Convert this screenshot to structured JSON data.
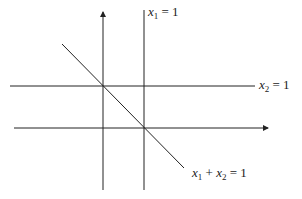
{
  "diagram": {
    "type": "linear-constraints",
    "axes": {
      "horizontal": "x1-axis",
      "vertical": "x2-axis"
    },
    "lines": [
      {
        "name": "x1 = 1",
        "var1": "x",
        "sub1": "1",
        "rhs": "= 1"
      },
      {
        "name": "x2 = 1",
        "var1": "x",
        "sub1": "2",
        "rhs": "= 1"
      },
      {
        "name": "x1 + x2 = 1",
        "var1": "x",
        "sub1": "1",
        "op": "+",
        "var2": "x",
        "sub2": "2",
        "rhs": "= 1"
      }
    ],
    "colors": {
      "line": "#222222",
      "background": "#ffffff"
    }
  }
}
